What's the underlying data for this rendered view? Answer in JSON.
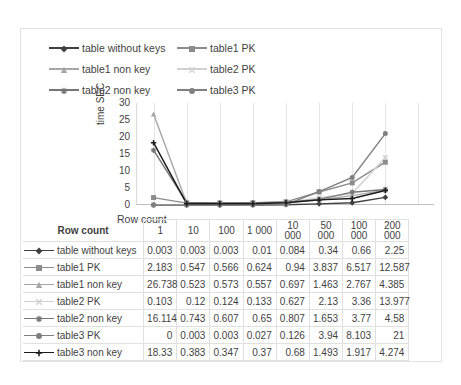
{
  "chart_data": {
    "type": "line",
    "title": "",
    "xlabel": "Row count",
    "ylabel": "time SEC",
    "ylim": [
      0,
      30
    ],
    "yticks": [
      30,
      25,
      20,
      15,
      10,
      5,
      0
    ],
    "grid": true,
    "legend_position": "top",
    "categories": [
      "1",
      "10",
      "100",
      "1 000",
      "10 000",
      "50 000",
      "100 000",
      "200 000"
    ],
    "series": [
      {
        "name": "table without keys",
        "marker": "diamond",
        "color": "#404040",
        "values": [
          0.003,
          0.003,
          0.003,
          0.01,
          0.084,
          0.34,
          0.66,
          2.25
        ]
      },
      {
        "name": "table1 PK",
        "marker": "square",
        "color": "#8c8c8c",
        "values": [
          2.183,
          0.547,
          0.566,
          0.624,
          0.94,
          3.837,
          6.517,
          12.587
        ]
      },
      {
        "name": "table1 non key",
        "marker": "triangle",
        "color": "#a6a6a6",
        "values": [
          26.738,
          0.523,
          0.573,
          0.557,
          0.697,
          1.463,
          2.767,
          4.385
        ]
      },
      {
        "name": "table2 PK",
        "marker": "cross",
        "color": "#d0d0d0",
        "values": [
          0.103,
          0.12,
          0.124,
          0.133,
          0.627,
          2.13,
          3.36,
          13.977
        ]
      },
      {
        "name": "table2 non key",
        "marker": "asterisk",
        "color": "#767676",
        "values": [
          16.114,
          0.743,
          0.607,
          0.65,
          0.807,
          1.653,
          3.77,
          4.58
        ]
      },
      {
        "name": "table3 PK",
        "marker": "circle",
        "color": "#7f7f7f",
        "values": [
          0,
          0.003,
          0.003,
          0.027,
          0.126,
          3.94,
          8.103,
          21
        ]
      },
      {
        "name": "table3 non key",
        "marker": "plus",
        "color": "#1a1a1a",
        "values": [
          18.33,
          0.383,
          0.347,
          0.37,
          0.68,
          1.493,
          1.917,
          4.274
        ]
      }
    ]
  },
  "legend": {
    "items": [
      {
        "label": "table without keys",
        "marker": "diamond",
        "color": "#404040"
      },
      {
        "label": "table1 PK",
        "marker": "square",
        "color": "#8c8c8c"
      },
      {
        "label": "table1 non key",
        "marker": "triangle",
        "color": "#a6a6a6"
      },
      {
        "label": "table2 PK",
        "marker": "cross",
        "color": "#d0d0d0"
      },
      {
        "label": "table2 non key",
        "marker": "asterisk",
        "color": "#767676"
      },
      {
        "label": "table3 PK",
        "marker": "circle",
        "color": "#7f7f7f"
      }
    ]
  },
  "table": {
    "corner_label": "Row count",
    "column_headers": [
      "1",
      "10",
      "100",
      "1 000",
      "10\n000",
      "50\n000",
      "100\n000",
      "200\n000"
    ],
    "rows": [
      {
        "name": "table without keys",
        "marker": "diamond",
        "color": "#404040",
        "values": [
          "0.003",
          "0.003",
          "0.003",
          "0.01",
          "0.084",
          "0.34",
          "0.66",
          "2.25"
        ]
      },
      {
        "name": "table1 PK",
        "marker": "square",
        "color": "#8c8c8c",
        "values": [
          "2.183",
          "0.547",
          "0.566",
          "0.624",
          "0.94",
          "3.837",
          "6.517",
          "12.587"
        ]
      },
      {
        "name": "table1 non key",
        "marker": "triangle",
        "color": "#a6a6a6",
        "values": [
          "26.738",
          "0.523",
          "0.573",
          "0.557",
          "0.697",
          "1.463",
          "2.767",
          "4.385"
        ]
      },
      {
        "name": "table2 PK",
        "marker": "cross",
        "color": "#d0d0d0",
        "values": [
          "0.103",
          "0.12",
          "0.124",
          "0.133",
          "0.627",
          "2.13",
          "3.36",
          "13.977"
        ]
      },
      {
        "name": "table2 non key",
        "marker": "asterisk",
        "color": "#767676",
        "values": [
          "16.114",
          "0.743",
          "0.607",
          "0.65",
          "0.807",
          "1.653",
          "3.77",
          "4.58"
        ]
      },
      {
        "name": "table3 PK",
        "marker": "circle",
        "color": "#7f7f7f",
        "values": [
          "0",
          "0.003",
          "0.003",
          "0.027",
          "0.126",
          "3.94",
          "8.103",
          "21"
        ]
      },
      {
        "name": "table3 non key",
        "marker": "plus",
        "color": "#1a1a1a",
        "values": [
          "18.33",
          "0.383",
          "0.347",
          "0.37",
          "0.68",
          "1.493",
          "1.917",
          "4.274"
        ]
      }
    ]
  }
}
